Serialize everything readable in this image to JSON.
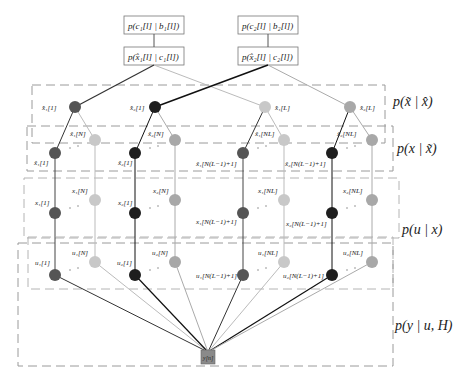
{
  "diagram": {
    "top_factors": [
      {
        "id": "f-c1",
        "label": "p(c₁[l] | b₁[l])"
      },
      {
        "id": "f-c2",
        "label": "p(c₂[l] | b₂[l])"
      }
    ],
    "mid_factors": [
      {
        "id": "f-x1hat",
        "label": "p(x̂₁[l] | c₁[l])"
      },
      {
        "id": "f-x2hat",
        "label": "p(x̂₂[l] | c₂[l])"
      }
    ],
    "layers": [
      {
        "id": "layer-xhat",
        "factor_label": "p(x̃ | x̂)"
      },
      {
        "id": "layer-xtilde",
        "factor_label": "p(x | x̃)"
      },
      {
        "id": "layer-x",
        "factor_label": "p(u | x)"
      },
      {
        "id": "layer-y",
        "factor_label": "p(y | u, H)"
      }
    ],
    "row1_labels": {
      "a": "x̂₁[1]",
      "b": "x̂₂[1]",
      "c": "x̂₁[L]",
      "d": "x̂₂[L]"
    },
    "row2_labels": {
      "a_top": "x̃₁[N]",
      "a_bot": "x̃₁[1]",
      "b_top": "x̃₂[N]",
      "b_bot": "x̃₂[1]",
      "c_top": "x̃₁[NL]",
      "c_bot": "x̃₁[N(L−1)+1]",
      "d_top": "x̃₂[NL]",
      "d_bot": "x̃₂[N(L−1)+1]"
    },
    "row3_labels": {
      "a_top": "x₁[N]",
      "a_bot": "x₁[1]",
      "b_top": "x₂[N]",
      "b_bot": "x₂[1]",
      "c_top": "x₁[NL]",
      "c_bot": "x₁[N(L−1)+1]",
      "d_top": "x₂[NL]",
      "d_bot": "x₂[N(L−1)+1]"
    },
    "row4_labels": {
      "a_top": "u₁[N]",
      "a_bot": "u₁[1]",
      "b_top": "u₂[N]",
      "b_bot": "u₂[1]",
      "c_top": "u₁[NL]",
      "c_bot": "u₁[N(L−1)+1]",
      "d_top": "u₂[NL]",
      "d_bot": "u₂[N(L−1)+1]"
    },
    "observation": {
      "label": "y[n]"
    },
    "ellipsis": "· ·",
    "colors": {
      "node_user1": "#555555",
      "node_user2": "#1e1e1e",
      "node_light1": "#c8c8c8",
      "node_light2": "#a8a8a8",
      "dash_box": "#9a9a9a",
      "obs_box": "#8a8a8a"
    }
  }
}
